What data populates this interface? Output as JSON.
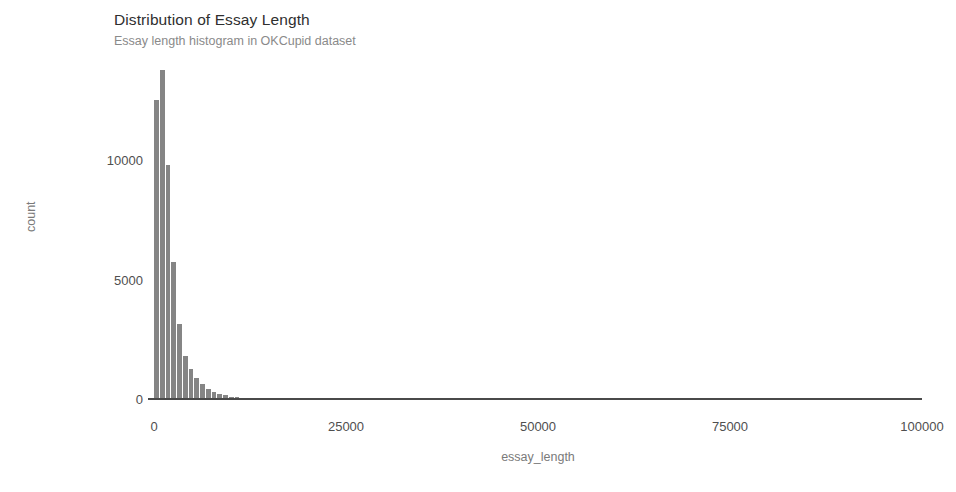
{
  "chart_data": {
    "type": "bar",
    "title": "Distribution of Essay Length",
    "subtitle": "Essay length histogram in OKCupid dataset",
    "xlabel": "essay_length",
    "ylabel": "count",
    "xlim": [
      0,
      100000
    ],
    "ylim": [
      0,
      14000
    ],
    "xticks": [
      0,
      25000,
      50000,
      75000,
      100000
    ],
    "xtick_labels": [
      "0",
      "25000",
      "50000",
      "75000",
      "100000"
    ],
    "yticks": [
      0,
      5000,
      10000
    ],
    "ytick_labels": [
      "0",
      "5000",
      "10000"
    ],
    "grid": false,
    "legend": null,
    "bar_color": "#858585",
    "bin_width": 750,
    "categories": [
      375,
      1125,
      1875,
      2625,
      3375,
      4125,
      4875,
      5625,
      6375,
      7125,
      7875,
      8625,
      9375,
      10125,
      10875,
      11625,
      12375,
      13125,
      13875,
      14625,
      15375,
      16125,
      16875,
      17625,
      18375,
      19125,
      19875,
      20625
    ],
    "values": [
      12550,
      13800,
      9800,
      5750,
      3150,
      1800,
      1250,
      880,
      620,
      430,
      300,
      210,
      150,
      105,
      72,
      52,
      38,
      28,
      20,
      15,
      11,
      9,
      7,
      5,
      4,
      3,
      3,
      2
    ]
  },
  "colors": {
    "bar": "#858585",
    "axis": "#4a4a4a",
    "tick_text": "#4f4f4f",
    "axis_title": "#7a7a7a",
    "title": "#2f2f2f",
    "subtitle": "#8a8a8a",
    "background": "#ffffff"
  }
}
